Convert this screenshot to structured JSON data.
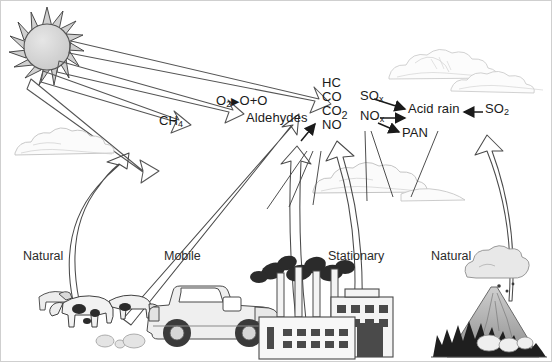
{
  "diagram": {
    "colors": {
      "ink": "#1a1a1a",
      "line": "#3a3a3a",
      "cloud": "#d8d8d8",
      "sun_fill": "#d6d6d6",
      "smoke": "#2b2b2b",
      "vehicle": "#e9e9e9",
      "factory": "#4a4a4a",
      "background": "#ffffff"
    },
    "sun": {
      "icon": "sun-icon",
      "rays": 16
    },
    "photolysis": {
      "reactant": "O",
      "reactant_sub": "2",
      "arrow": "▶",
      "products": "O+O"
    },
    "aldehydes_label": "Aldehydes",
    "methane_label": "CH",
    "methane_sub": "4",
    "primary_pollutants": [
      {
        "formula": "HC",
        "sub": ""
      },
      {
        "formula": "CO",
        "sub": ""
      },
      {
        "formula": "CO",
        "sub": "2"
      },
      {
        "formula": "NO",
        "sub": ""
      }
    ],
    "oxides": [
      {
        "formula": "SO",
        "sub": "x"
      },
      {
        "formula": "NO",
        "sub": "x"
      }
    ],
    "acid_rain_label": "Acid rain",
    "so2": {
      "formula": "SO",
      "sub": "2"
    },
    "pan_label": "PAN",
    "sources": [
      {
        "name": "source-natural-livestock",
        "label": "Natural",
        "x": 22,
        "y": 248
      },
      {
        "name": "source-mobile-vehicle",
        "label": "Mobile",
        "x": 163,
        "y": 248
      },
      {
        "name": "source-stationary-factory",
        "label": "Stationary",
        "x": 327,
        "y": 248
      },
      {
        "name": "source-natural-volcano",
        "label": "Natural",
        "x": 430,
        "y": 248
      }
    ],
    "clouds": [
      {
        "name": "cloud-left",
        "x": 8,
        "y": 128
      },
      {
        "name": "cloud-center",
        "x": 310,
        "y": 155
      },
      {
        "name": "cloud-upper-right",
        "x": 385,
        "y": 28
      },
      {
        "name": "cloud-lower-right",
        "x": 452,
        "y": 58
      }
    ]
  }
}
